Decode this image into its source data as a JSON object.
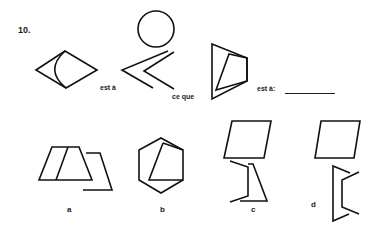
{
  "question": {
    "number": "10.",
    "phrase_1": "est à",
    "phrase_2": "ce que",
    "phrase_3": "est à:",
    "answer_blank": ""
  },
  "options": [
    {
      "label": "a"
    },
    {
      "label": "b"
    },
    {
      "label": "c"
    },
    {
      "label": "d"
    }
  ],
  "colors": {
    "ink": "#111111",
    "background": "#ffffff"
  }
}
